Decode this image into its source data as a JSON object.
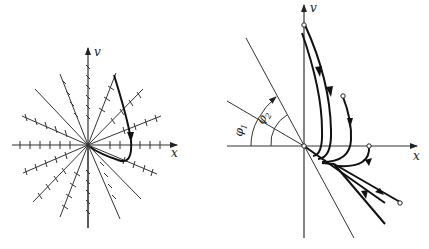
{
  "figure": {
    "left_panel": {
      "description": "Phase plane with isoclines (lines through origin with short slope marks) and one trajectory",
      "x_axis_label": "x",
      "y_axis_label": "v",
      "isocline_count": 12
    },
    "right_panel": {
      "description": "Phase plane trajectories approaching origin along two straight-line directions",
      "x_axis_label": "x",
      "y_axis_label": "v",
      "angle_labels": [
        {
          "symbol": "φ",
          "subscript": "1"
        },
        {
          "symbol": "φ",
          "subscript": "2"
        }
      ]
    }
  }
}
